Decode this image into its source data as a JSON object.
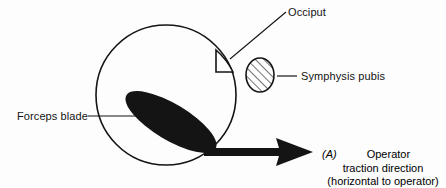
{
  "figure": {
    "panel_marker": "(A)",
    "background_color": "#fdfdfd",
    "ink_color": "#141414"
  },
  "labels": {
    "occiput": "Occiput",
    "symphysis_pubis": "Symphysis pubis",
    "forceps_blade": "Forceps blade",
    "traction_operator": "Operator",
    "traction_direction": "traction direction",
    "traction_qualifier": "(horizontal to operator)"
  },
  "shapes": {
    "fetal_head": {
      "name": "fetal-head-circle",
      "cx": 166,
      "cy": 95,
      "r": 70,
      "fill": "none",
      "stroke": "#141414"
    },
    "occiput_wedge": {
      "name": "occiput-wedge",
      "fill": "none",
      "stroke": "#141414"
    },
    "symphysis_pubis": {
      "name": "symphysis-pubis-ellipse",
      "cx": 260,
      "cy": 75,
      "rx": 14,
      "ry": 17,
      "fill": "hatched",
      "stroke": "#141414"
    },
    "forceps_blade": {
      "name": "forceps-blade-ellipse",
      "cx": 171,
      "cy": 122,
      "rx": 52,
      "ry": 18,
      "rotation_deg": 31,
      "fill": "#141414"
    },
    "traction_arrow": {
      "name": "traction-arrow",
      "x_start": 204,
      "x_tip": 313,
      "y": 152,
      "shaft_thickness": 8,
      "fill": "#141414"
    }
  },
  "leaders": {
    "occiput": {
      "x1": 286,
      "y1": 12,
      "x2": 231,
      "y2": 59
    },
    "symphysis": {
      "x1": 277,
      "y1": 76,
      "x2": 297,
      "y2": 76
    },
    "forceps": {
      "x1": 88,
      "y1": 116,
      "x2": 138,
      "y2": 116
    }
  }
}
